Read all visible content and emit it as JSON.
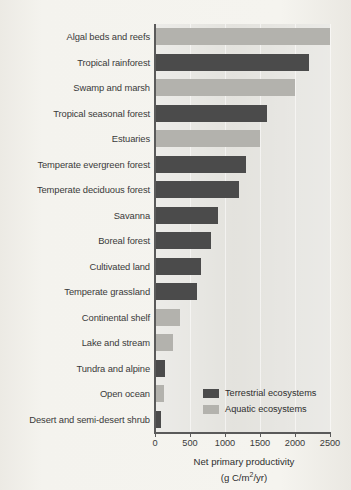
{
  "chart_data": {
    "type": "bar",
    "orientation": "horizontal",
    "title": "",
    "xlabel": "Net primary productivity",
    "xlabel_units": "(g C/m2/yr)",
    "ylabel": "",
    "xlim": [
      0,
      2500
    ],
    "xticks": [
      0,
      500,
      1000,
      1500,
      2000,
      2500
    ],
    "xtick_labels": [
      "0",
      "500",
      "1000",
      "1500",
      "2000",
      "2500"
    ],
    "grid": true,
    "legend_position": "inside-lower-right",
    "categories": [
      "Algal beds and reefs",
      "Tropical rainforest",
      "Swamp and marsh",
      "Tropical seasonal forest",
      "Estuaries",
      "Temperate evergreen forest",
      "Temperate deciduous forest",
      "Savanna",
      "Boreal forest",
      "Cultivated land",
      "Temperate grassland",
      "Continental shelf",
      "Lake and stream",
      "Tundra and alpine",
      "Open ocean",
      "Desert and semi-desert shrub"
    ],
    "values": [
      2500,
      2200,
      2000,
      1600,
      1500,
      1300,
      1200,
      900,
      800,
      650,
      600,
      360,
      250,
      140,
      125,
      90
    ],
    "groups": [
      "aquatic",
      "terrestrial",
      "aquatic",
      "terrestrial",
      "aquatic",
      "terrestrial",
      "terrestrial",
      "terrestrial",
      "terrestrial",
      "terrestrial",
      "terrestrial",
      "aquatic",
      "aquatic",
      "terrestrial",
      "aquatic",
      "terrestrial"
    ],
    "series": [
      {
        "name": "Terrestrial ecosystems",
        "color": "#4b4b4b",
        "points": [
          {
            "category": "Tropical rainforest",
            "value": 2200
          },
          {
            "category": "Tropical seasonal forest",
            "value": 1600
          },
          {
            "category": "Temperate evergreen forest",
            "value": 1300
          },
          {
            "category": "Temperate deciduous forest",
            "value": 1200
          },
          {
            "category": "Savanna",
            "value": 900
          },
          {
            "category": "Boreal forest",
            "value": 800
          },
          {
            "category": "Cultivated land",
            "value": 650
          },
          {
            "category": "Temperate grassland",
            "value": 600
          },
          {
            "category": "Tundra and alpine",
            "value": 140
          },
          {
            "category": "Desert and semi-desert shrub",
            "value": 90
          }
        ]
      },
      {
        "name": "Aquatic ecosystems",
        "color": "#b3b2ad",
        "points": [
          {
            "category": "Algal beds and reefs",
            "value": 2500
          },
          {
            "category": "Swamp and marsh",
            "value": 2000
          },
          {
            "category": "Estuaries",
            "value": 1500
          },
          {
            "category": "Continental shelf",
            "value": 360
          },
          {
            "category": "Lake and stream",
            "value": 250
          },
          {
            "category": "Open ocean",
            "value": 125
          }
        ]
      }
    ]
  },
  "legend": {
    "items": [
      {
        "label": "Terrestrial ecosystems",
        "group": "terrestrial",
        "color": "#4b4b4b"
      },
      {
        "label": "Aquatic ecosystems",
        "group": "aquatic",
        "color": "#b3b2ad"
      }
    ]
  },
  "axis": {
    "title_line1": "Net primary productivity",
    "title_units_prefix": "(g C/m",
    "title_units_sup": "2",
    "title_units_suffix": "/yr)"
  },
  "colors": {
    "terrestrial": "#4b4b4b",
    "aquatic": "#b3b2ad",
    "panel": "#e2e1dc",
    "page": "#f2f1ec",
    "axis": "#5a5a5a",
    "text": "#2e2e2e"
  }
}
